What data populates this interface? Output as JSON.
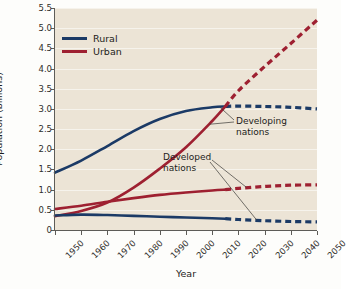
{
  "chart_data": {
    "type": "line",
    "title": "",
    "xlabel": "Year",
    "ylabel": "Population (billions)",
    "xlim": [
      1950,
      2050
    ],
    "ylim": [
      0,
      5.5
    ],
    "xticks": [
      1950,
      1960,
      1970,
      1980,
      1990,
      2000,
      2010,
      2020,
      2030,
      2040,
      2050
    ],
    "yticks": [
      "0",
      "0.5",
      "1.0",
      "1.5",
      "2.0",
      "2.5",
      "3.0",
      "3.5",
      "4.0",
      "4.5",
      "5.0",
      "5.5"
    ],
    "grid": "horizontal",
    "legend_position": "top-left",
    "projection_starts": 2015,
    "legend": [
      {
        "label": "Rural",
        "color": "#1b3a66"
      },
      {
        "label": "Urban",
        "color": "#9e2031"
      }
    ],
    "annotations": [
      {
        "text_line1": "Developing",
        "text_line2": "nations"
      },
      {
        "text_line1": "Developed",
        "text_line2": "nations"
      }
    ],
    "x": [
      1950,
      1960,
      1970,
      1980,
      1990,
      2000,
      2010,
      2015,
      2020,
      2030,
      2040,
      2050
    ],
    "series": [
      {
        "name": "Rural — Developing nations",
        "color": "#1b3a66",
        "style": "solid-then-dashed",
        "values": [
          1.42,
          1.72,
          2.08,
          2.45,
          2.75,
          2.95,
          3.04,
          3.06,
          3.07,
          3.06,
          3.04,
          3.0
        ]
      },
      {
        "name": "Urban — Developing nations",
        "color": "#9e2031",
        "style": "solid-then-dashed",
        "values": [
          0.34,
          0.47,
          0.68,
          1.05,
          1.52,
          2.05,
          2.7,
          3.06,
          3.45,
          4.05,
          4.62,
          5.2
        ]
      },
      {
        "name": "Urban — Developed nations",
        "color": "#9e2031",
        "style": "solid-then-dashed",
        "values": [
          0.52,
          0.6,
          0.7,
          0.79,
          0.87,
          0.93,
          0.98,
          1.0,
          1.03,
          1.08,
          1.11,
          1.12
        ]
      },
      {
        "name": "Rural — Developed nations",
        "color": "#1b3a66",
        "style": "solid-then-dashed",
        "values": [
          0.36,
          0.38,
          0.37,
          0.35,
          0.33,
          0.31,
          0.29,
          0.28,
          0.26,
          0.23,
          0.21,
          0.2
        ]
      }
    ]
  }
}
